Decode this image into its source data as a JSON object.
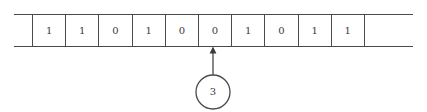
{
  "diagram": {
    "type": "turing-machine-tape",
    "line_color": "#4a4a4a",
    "text_color": "#3b3b3b",
    "background_color": "#ffffff"
  },
  "tape": {
    "leading_cell": {
      "value": "",
      "label": "empty-leading-cell"
    },
    "trailing_cell": {
      "value": "",
      "label": "empty-trailing-cell"
    },
    "cells": [
      {
        "index": 0,
        "value": "1"
      },
      {
        "index": 1,
        "value": "1"
      },
      {
        "index": 2,
        "value": "0"
      },
      {
        "index": 3,
        "value": "1"
      },
      {
        "index": 4,
        "value": "0"
      },
      {
        "index": 5,
        "value": "0"
      },
      {
        "index": 6,
        "value": "1"
      },
      {
        "index": 7,
        "value": "0"
      },
      {
        "index": 8,
        "value": "1"
      },
      {
        "index": 9,
        "value": "1"
      }
    ]
  },
  "head": {
    "label": "3",
    "points_to_cell_index": 5,
    "pointed_cell_value": "0",
    "icon": "up-arrow-icon"
  }
}
